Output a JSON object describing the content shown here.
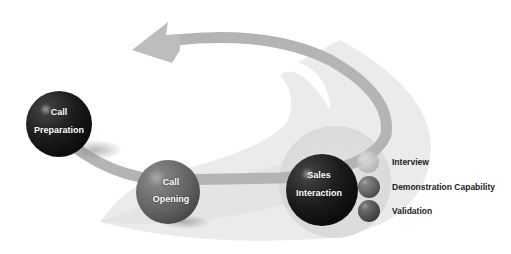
{
  "diagram": {
    "type": "cycle",
    "stages": [
      {
        "id": "call-preparation",
        "line1": "Call",
        "line2": "Preparation",
        "tone": "dark"
      },
      {
        "id": "call-opening",
        "line1": "Call",
        "line2": "Opening",
        "tone": "medium"
      },
      {
        "id": "sales-interaction",
        "line1": "Sales",
        "line2": "Interaction",
        "tone": "dark"
      }
    ],
    "legend": [
      {
        "label": "Interview",
        "tone": "light"
      },
      {
        "label": "Demonstration Capability",
        "tone": "medium"
      },
      {
        "label": "Validation",
        "tone": "medium-dark"
      }
    ],
    "colors": {
      "arrow": "#b9b9b9",
      "band": "#e6e6e6",
      "sphere_dark": "#1e1e1e",
      "sphere_medium": "#6b6b6b",
      "text": "#222222"
    }
  }
}
